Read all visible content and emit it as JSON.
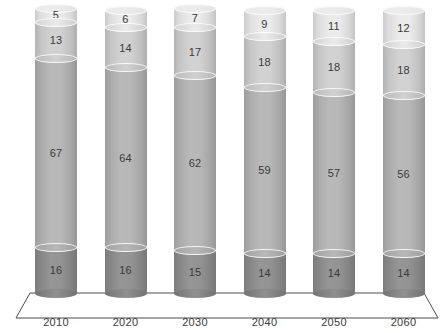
{
  "chart": {
    "type": "stacked-bar-3d-cylinder",
    "background_color": "#ffffff",
    "label_color": "#3a3a3a",
    "floor_line_color": "#4d4d4d"
  },
  "chart_data": {
    "type": "bar",
    "title": "",
    "subtitle": "",
    "xlabel": "",
    "ylabel": "",
    "stacked": true,
    "grid": false,
    "legend": "none",
    "ylim": [
      0,
      101
    ],
    "categories": [
      "2010",
      "2020",
      "2030",
      "2040",
      "2050",
      "2060"
    ],
    "series": [
      {
        "name": "segment-bottom",
        "color": "#8e8e8e",
        "values": [
          16,
          16,
          15,
          14,
          14,
          14
        ]
      },
      {
        "name": "segment-lower-middle",
        "color": "#b4b4b4",
        "values": [
          67,
          64,
          62,
          59,
          57,
          56
        ]
      },
      {
        "name": "segment-upper-middle",
        "color": "#cfcfcf",
        "values": [
          13,
          14,
          17,
          18,
          18,
          18
        ]
      },
      {
        "name": "segment-top",
        "color": "#eaeaea",
        "values": [
          5,
          6,
          7,
          9,
          11,
          12
        ]
      }
    ],
    "totals": [
      101,
      100,
      101,
      100,
      100,
      100
    ]
  },
  "axis": {
    "x_tick_labels": [
      "2010",
      "2020",
      "2030",
      "2040",
      "2050",
      "2060"
    ]
  }
}
